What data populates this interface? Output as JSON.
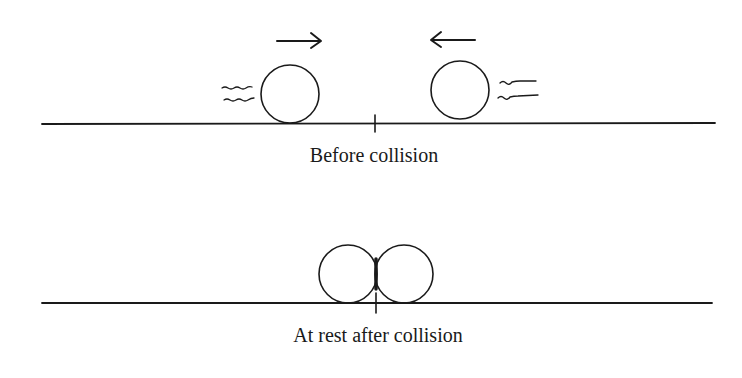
{
  "diagram": {
    "panels": [
      {
        "caption": "Before collision",
        "objects": [
          "ball-left-moving-right",
          "ball-right-moving-left"
        ],
        "arrows": [
          "right-arrow",
          "left-arrow"
        ],
        "motion_marks": [
          "left-ball-motion-lines",
          "right-ball-motion-lines"
        ]
      },
      {
        "caption": "At rest after collision",
        "objects": [
          "ball-left-at-rest",
          "ball-right-at-rest"
        ]
      }
    ],
    "stroke_color": "#1a1a1a",
    "background_color": "#ffffff"
  }
}
